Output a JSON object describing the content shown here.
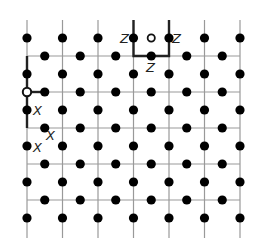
{
  "diagram": {
    "lattice": {
      "columns": 7,
      "rows": 5,
      "qubit_color": "#000000",
      "grid_line_color": "#999999",
      "highlight_color": "#222222"
    },
    "labels": {
      "z_left": "Z",
      "z_right": "Z",
      "z_bottom": "Z",
      "x_top": "X",
      "x_right": "X",
      "x_bottom": "X"
    },
    "plaquette_operator": {
      "name": "Z-plaquette",
      "qubits": 3,
      "label": "Z",
      "cell_col": 3,
      "cell_row_above_line": 0
    },
    "star_operator": {
      "name": "X-star",
      "qubits": 3,
      "label": "X",
      "vertex_col": 0,
      "vertex_row": 1
    }
  }
}
